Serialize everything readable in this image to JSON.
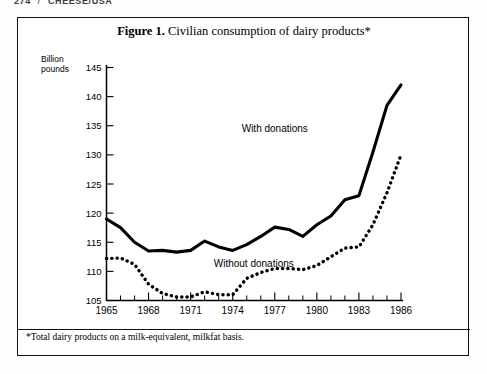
{
  "running_head": {
    "page_number": "274",
    "separator": "/",
    "section": "CHEESE/USA"
  },
  "figure": {
    "label": "Figure 1.",
    "title": "Civilian consumption of dairy products*",
    "footnote": "*Total dairy products on a milk-equivalent, milkfat basis."
  },
  "chart_data": {
    "type": "line",
    "title": "Figure 1.  Civilian consumption of dairy products*",
    "xlabel": "",
    "ylabel": "Billion pounds",
    "xlim": [
      1965,
      1986
    ],
    "ylim": [
      105,
      145
    ],
    "ytick_labels": [
      "105",
      "110",
      "115",
      "120",
      "125",
      "130",
      "135",
      "140",
      "145"
    ],
    "yticks": [
      105,
      110,
      115,
      120,
      125,
      130,
      135,
      140,
      145
    ],
    "xtick_labels": [
      "1965",
      "1968",
      "1971",
      "1974",
      "1977",
      "1980",
      "1983",
      "1986"
    ],
    "xticks_major": [
      1965,
      1968,
      1971,
      1974,
      1977,
      1980,
      1983,
      1986
    ],
    "xticks_minor": [
      1966,
      1967,
      1969,
      1970,
      1972,
      1973,
      1975,
      1976,
      1978,
      1979,
      1981,
      1982,
      1984,
      1985
    ],
    "grid": false,
    "legend_position": "inline-annotation",
    "x": [
      1965,
      1966,
      1967,
      1968,
      1969,
      1970,
      1971,
      1972,
      1973,
      1974,
      1975,
      1976,
      1977,
      1978,
      1979,
      1980,
      1981,
      1982,
      1983,
      1984,
      1985,
      1986
    ],
    "series": [
      {
        "name": "With donations",
        "style": "solid",
        "values": [
          119.0,
          117.5,
          115.0,
          113.5,
          113.6,
          113.3,
          113.6,
          115.2,
          114.2,
          113.6,
          114.6,
          116.0,
          117.6,
          117.2,
          116.0,
          118.0,
          119.5,
          122.3,
          123.0,
          130.5,
          138.5,
          142.0
        ]
      },
      {
        "name": "Without donations",
        "style": "dotted",
        "values": [
          112.2,
          112.3,
          111.2,
          107.8,
          106.2,
          105.6,
          105.6,
          106.5,
          106.0,
          106.0,
          108.8,
          109.8,
          110.5,
          110.5,
          110.3,
          111.0,
          112.5,
          114.0,
          114.2,
          118.0,
          123.5,
          130.0
        ]
      }
    ],
    "annotations": [
      {
        "text": "With donations",
        "x": 1977.0,
        "y": 134.0
      },
      {
        "text": "Without donations",
        "x": 1975.5,
        "y": 110.8
      }
    ]
  },
  "colors": {
    "ink": "#000000",
    "paper": "#ffffff"
  }
}
